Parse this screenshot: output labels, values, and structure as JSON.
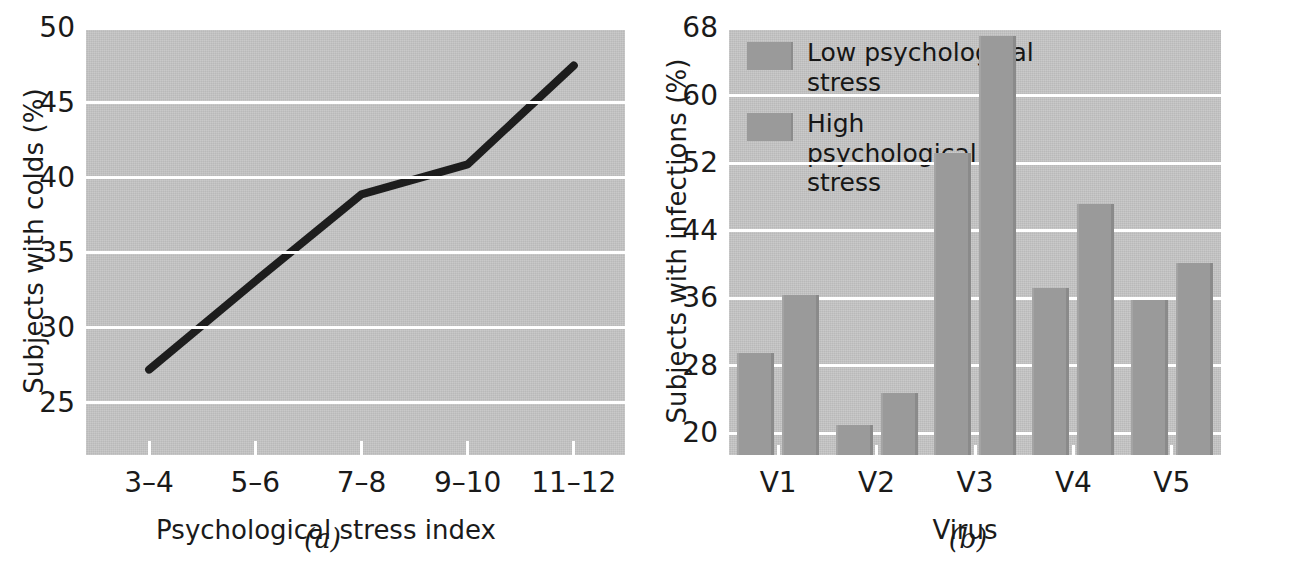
{
  "chart_data": [
    {
      "type": "line",
      "panel_caption": "(a)",
      "title": "",
      "xlabel": "Psychological stress index",
      "ylabel": "Subjects with colds (%)",
      "categories": [
        "3–4",
        "5–6",
        "7–8",
        "9–10",
        "11–12"
      ],
      "values": [
        27.2,
        33.1,
        38.9,
        40.9,
        47.5
      ],
      "yticks": [
        25,
        30,
        35,
        40,
        45,
        50
      ],
      "ylim": [
        21.5,
        50
      ],
      "grid": true,
      "legend": "none",
      "series_color": "#1d1d1d",
      "plot_background": "#c6c6c6"
    },
    {
      "type": "bar",
      "panel_caption": "(b)",
      "title": "",
      "xlabel": "Virus",
      "ylabel": "Subjects with infections (%)",
      "categories": [
        "V1",
        "V2",
        "V3",
        "V4",
        "V5"
      ],
      "series": [
        {
          "name": "Low psychological stress",
          "values": [
            29.5,
            21.0,
            53.2,
            37.2,
            35.8
          ],
          "color": "#9a9a9a"
        },
        {
          "name": "High psychological stress",
          "values": [
            36.4,
            24.7,
            67.0,
            47.2,
            40.2
          ],
          "color": "#9a9a9a"
        }
      ],
      "yticks": [
        20,
        28,
        36,
        44,
        52,
        60,
        68
      ],
      "ylim": [
        17.4,
        68
      ],
      "grid": true,
      "legend": "upper-left",
      "plot_background": "#c6c6c6"
    }
  ]
}
